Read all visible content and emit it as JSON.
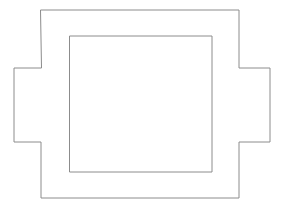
{
  "canvas": {
    "width": 282,
    "height": 211,
    "background_color": "#ffffff",
    "title": "Line drawing of a notched rectangular outline with an inner rectangle"
  },
  "style": {
    "stroke_color": "#8c8c8c",
    "stroke_width": 1,
    "fill_color": "#ffffff"
  },
  "shapes": [
    {
      "name": "outer-notched-rectangle",
      "type": "polygon",
      "description": "Rectangle with rectangular tabs protruding from the left and right middle edges",
      "points": "41,10 239,10 239,68 270,68 270,142 239,142 239,198 41,198 41,142 14,142 14,68 41,68",
      "bounds": {
        "x": 14,
        "y": 10,
        "width": 256,
        "height": 188
      },
      "body": {
        "left": 41,
        "top": 10,
        "right": 239,
        "bottom": 198
      },
      "left_tab": {
        "left": 14,
        "top": 68,
        "right": 41,
        "bottom": 142
      },
      "right_tab": {
        "left": 239,
        "top": 68,
        "right": 270,
        "bottom": 142
      }
    },
    {
      "name": "inner-rectangle",
      "type": "rect",
      "description": "Plain rectangle centered inside the outer outline",
      "x": 70,
      "y": 36,
      "width": 142,
      "height": 136,
      "bounds": {
        "x": 70,
        "y": 36,
        "width": 142,
        "height": 136
      }
    }
  ]
}
